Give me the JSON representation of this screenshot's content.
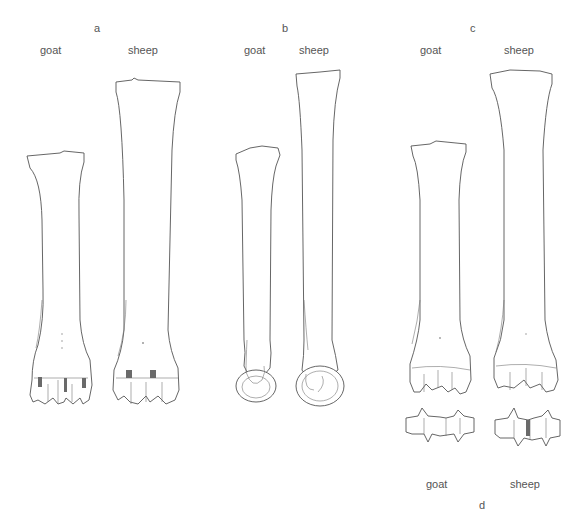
{
  "figure": {
    "panels": [
      {
        "id": "a",
        "letter": "a",
        "labels": {
          "left": "goat",
          "right": "sheep"
        },
        "view": "anterior metacarpal"
      },
      {
        "id": "b",
        "letter": "b",
        "labels": {
          "left": "goat",
          "right": "sheep"
        },
        "view": "lateral metacarpal"
      },
      {
        "id": "c",
        "letter": "c",
        "labels": {
          "left": "goat",
          "right": "sheep"
        },
        "view": "posterior metacarpal"
      },
      {
        "id": "d",
        "letter": "d",
        "labels": {
          "left": "goat",
          "right": "sheep"
        },
        "view": "distal condyles"
      }
    ],
    "colors": {
      "line": "#555555",
      "text": "#555555",
      "background": "#ffffff"
    }
  }
}
